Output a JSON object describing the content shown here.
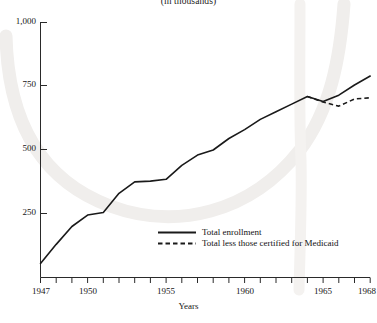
{
  "chart_data": {
    "type": "line",
    "title": "(in thousands)",
    "xlabel": "Years",
    "ylabel": "",
    "xlim": [
      1947,
      1968
    ],
    "ylim": [
      0,
      1000
    ],
    "xticks": [
      1947,
      1948,
      1949,
      1950,
      1951,
      1952,
      1953,
      1954,
      1955,
      1956,
      1957,
      1958,
      1959,
      1960,
      1961,
      1962,
      1963,
      1964,
      1965,
      1966,
      1967,
      1968
    ],
    "xtick_labels": [
      {
        "value": 1947,
        "label": "1947"
      },
      {
        "value": 1950,
        "label": "1950"
      },
      {
        "value": 1955,
        "label": "1955"
      },
      {
        "value": 1960,
        "label": "1960"
      },
      {
        "value": 1965,
        "label": "1965"
      },
      {
        "value": 1968,
        "label": "1968"
      }
    ],
    "yticks": [
      250,
      500,
      750,
      1000
    ],
    "ytick_labels": [
      "250",
      "500",
      "750",
      "1,000"
    ],
    "grid": false,
    "legend_position": "inside-bottom-center",
    "series": [
      {
        "name": "Total enrollment",
        "style": "solid",
        "color": "#1a1a1a",
        "x": [
          1947,
          1948,
          1949,
          1950,
          1951,
          1952,
          1953,
          1954,
          1955,
          1956,
          1957,
          1958,
          1959,
          1960,
          1961,
          1962,
          1963,
          1964,
          1965,
          1966,
          1967,
          1968
        ],
        "values": [
          55,
          130,
          200,
          245,
          255,
          330,
          375,
          378,
          385,
          440,
          480,
          500,
          545,
          580,
          620,
          650,
          680,
          710,
          690,
          715,
          755,
          790
        ]
      },
      {
        "name": "Total less those certified for Medicaid",
        "style": "dashed",
        "color": "#1a1a1a",
        "x": [
          1964,
          1965,
          1966,
          1967,
          1968
        ],
        "values": [
          710,
          688,
          672,
          700,
          705
        ]
      }
    ]
  },
  "legend": {
    "items": [
      {
        "label": "Total enrollment",
        "style": "solid"
      },
      {
        "label": "Total less those certified for Medicaid",
        "style": "dashed"
      }
    ]
  }
}
